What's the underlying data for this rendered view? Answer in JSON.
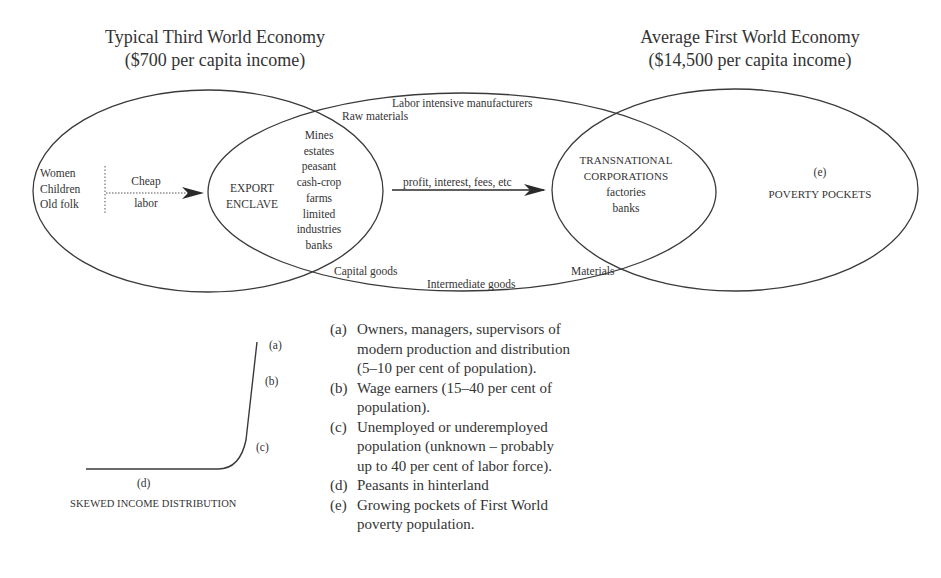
{
  "titles": {
    "left_line1": "Typical Third World Economy",
    "left_line2": "($700 per capita income)",
    "right_line1": "Average First World Economy",
    "right_line2": "($14,500 per capita income)"
  },
  "third_world": {
    "groups": [
      "Women",
      "Children",
      "Old folk"
    ],
    "flow_top": "Cheap",
    "flow_bottom": "labor",
    "enclave_line1": "EXPORT",
    "enclave_line2": "ENCLAVE",
    "enclave_items": [
      "Mines",
      "estates",
      "peasant",
      "cash-crop",
      "farms",
      "limited",
      "industries",
      "banks"
    ]
  },
  "trade": {
    "top_outer": "Labor intensive manufacturers",
    "top_inner": "Raw materials",
    "bottom_left": "Capital goods",
    "bottom_center": "Intermediate goods",
    "bottom_right": "Materials",
    "profit_arrow": "profit, interest, fees, etc"
  },
  "first_world": {
    "tnc_line1": "TRANSNATIONAL",
    "tnc_line2": "CORPORATIONS",
    "tnc_line3": "factories",
    "tnc_line4": "banks",
    "poverty_key": "(e)",
    "poverty_label": "POVERTY POCKETS"
  },
  "distribution": {
    "title": "SKEWED INCOME DISTRIBUTION",
    "labels": {
      "a": "(a)",
      "b": "(b)",
      "c": "(c)",
      "d": "(d)"
    }
  },
  "legend": [
    {
      "key": "(a)",
      "text": "Owners, managers, supervisors of modern production and distribution (5–10 per cent of population)."
    },
    {
      "key": "(b)",
      "text": "Wage earners (15–40 per cent of population)."
    },
    {
      "key": "(c)",
      "text": "Unemployed or underemployed population (unknown – probably up to 40 per cent of labor force)."
    },
    {
      "key": "(d)",
      "text": "Peasants in hinterland"
    },
    {
      "key": "(e)",
      "text": "Growing pockets of First World poverty population."
    }
  ],
  "colors": {
    "line": "#3a3a3a",
    "text": "#333333",
    "background": "#ffffff"
  }
}
